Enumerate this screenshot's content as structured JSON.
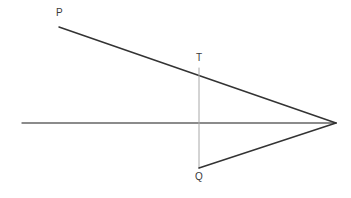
{
  "figure": {
    "width": 351,
    "height": 198,
    "background": "#ffffff"
  },
  "colors": {
    "ray": "#333333",
    "axis": "#666666",
    "object_line": "#a8a8a8",
    "label": "#3a3a3a"
  },
  "labels": [
    {
      "id": "P",
      "text": "P",
      "x": 56,
      "y": 8
    },
    {
      "id": "T",
      "text": "T",
      "x": 196,
      "y": 53
    },
    {
      "id": "Q",
      "text": "Q",
      "x": 195,
      "y": 172
    }
  ],
  "points": {
    "P": {
      "x": 59,
      "y": 27
    },
    "T": {
      "x": 199,
      "y": 68
    },
    "Q": {
      "x": 199,
      "y": 168
    },
    "F": {
      "x": 336,
      "y": 123
    },
    "axis_left": {
      "x": 22,
      "y": 123
    }
  },
  "segments": [
    {
      "id": "optical-axis",
      "name": "optical-axis-line",
      "x1": 22,
      "y1": 123,
      "x2": 336,
      "y2": 123,
      "color": "#666666",
      "width": 1.4
    },
    {
      "id": "upper-ray",
      "name": "upper-ray-p-to-focus",
      "x1": 59,
      "y1": 27,
      "x2": 336,
      "y2": 123,
      "color": "#333333",
      "width": 1.5
    },
    {
      "id": "object-line",
      "name": "object-segment-t-to-q",
      "x1": 199,
      "y1": 68,
      "x2": 199,
      "y2": 168,
      "color": "#a8a8a8",
      "width": 1.0
    },
    {
      "id": "lower-ray",
      "name": "lower-ray-q-to-focus",
      "x1": 199,
      "y1": 168,
      "x2": 336,
      "y2": 123,
      "color": "#333333",
      "width": 1.5
    }
  ]
}
